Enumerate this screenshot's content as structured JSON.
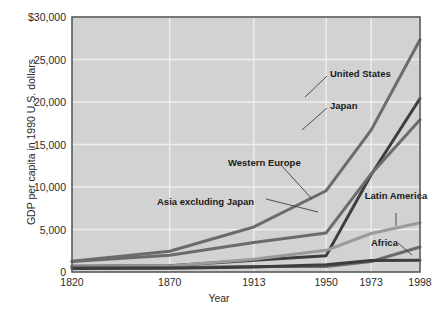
{
  "chart_data": {
    "type": "line",
    "title": "",
    "xlabel": "Year",
    "ylabel": "GDP per capita in 1990 U.S. dollars",
    "x": [
      1820,
      1870,
      1913,
      1950,
      1973,
      1998
    ],
    "xticklabels": [
      "1820",
      "1870",
      "1913",
      "1950",
      "1973",
      "1998"
    ],
    "yticklabels": [
      "$30,000",
      "25,000",
      "20,000",
      "15,000",
      "10,000",
      "5,000",
      "0"
    ],
    "ytickvalues": [
      30000,
      25000,
      20000,
      15000,
      10000,
      5000,
      0
    ],
    "xlim": [
      1820,
      1998
    ],
    "ylim": [
      0,
      30000
    ],
    "grid": true,
    "legend_position": "inline-annotations",
    "series": [
      {
        "name": "United States",
        "color": "#6b6b6b",
        "width": 3.0,
        "values": [
          1257,
          2445,
          5301,
          9561,
          16689,
          27331
        ]
      },
      {
        "name": "Japan",
        "color": "#3d3d3d",
        "width": 3.0,
        "values": [
          669,
          737,
          1387,
          1926,
          11439,
          20413
        ]
      },
      {
        "name": "Western Europe",
        "color": "#6b6b6b",
        "width": 3.0,
        "values": [
          1232,
          1974,
          3473,
          4594,
          11534,
          17921
        ]
      },
      {
        "name": "Latin America",
        "color": "#9a9a9a",
        "width": 3.0,
        "values": [
          665,
          698,
          1511,
          2554,
          4531,
          5795
        ]
      },
      {
        "name": "Asia excluding Japan",
        "color": "#6b6b6b",
        "width": 3.0,
        "values": [
          575,
          543,
          640,
          635,
          1231,
          2936
        ]
      },
      {
        "name": "Africa",
        "color": "#3d3d3d",
        "width": 3.0,
        "values": [
          418,
          444,
          585,
          852,
          1365,
          1368
        ]
      }
    ],
    "annotations": [
      {
        "label": "United States",
        "x": 330,
        "y": 68,
        "align": "left",
        "leader": [
          [
            327,
            76
          ],
          [
            305,
            97
          ]
        ]
      },
      {
        "label": "Japan",
        "x": 330,
        "y": 100,
        "align": "left",
        "leader": [
          [
            327,
            108
          ],
          [
            302,
            130
          ]
        ]
      },
      {
        "label": "Western Europe",
        "x": 228,
        "y": 157,
        "align": "left",
        "leader": [
          [
            281,
            165
          ],
          [
            312,
            199
          ]
        ]
      },
      {
        "label": "Asia excluding Japan",
        "x": 157,
        "y": 196,
        "align": "left",
        "leader": [
          [
            266,
            199
          ],
          [
            318,
            212
          ]
        ]
      },
      {
        "label": "Latin America",
        "x": 396,
        "y": 190,
        "align": "center",
        "leader": [
          [
            396,
            213
          ],
          [
            396,
            226
          ]
        ]
      },
      {
        "label": "Africa",
        "x": 371,
        "y": 237,
        "align": "left",
        "leader": [
          [
            398,
            243
          ],
          [
            412,
            255
          ]
        ]
      }
    ],
    "style": {
      "plot_bg": "#d2d2d2",
      "page_bg": "#ffffff",
      "grid_color": "#eeeeee",
      "border_color": "#5a5a5a",
      "text_color": "#2b2b2b"
    }
  }
}
